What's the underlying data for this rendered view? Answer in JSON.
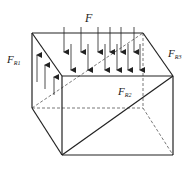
{
  "diagram": {
    "type": "free-body prism diagram",
    "labels": {
      "load": {
        "main": "F",
        "sub": ""
      },
      "reaction1": {
        "main": "F",
        "sub": "R1"
      },
      "reaction2": {
        "main": "F",
        "sub": "R2"
      },
      "reaction3": {
        "main": "F",
        "sub": "R3"
      }
    },
    "load_arrows_back_x": [
      64,
      81,
      98,
      110,
      121,
      134
    ],
    "load_arrows_front_x": [
      71,
      88,
      105,
      117,
      128,
      140
    ],
    "reaction_arrows_left_count": 3,
    "colors": {
      "line": "#222222",
      "dashed": "#555555",
      "background": "#ffffff"
    }
  }
}
